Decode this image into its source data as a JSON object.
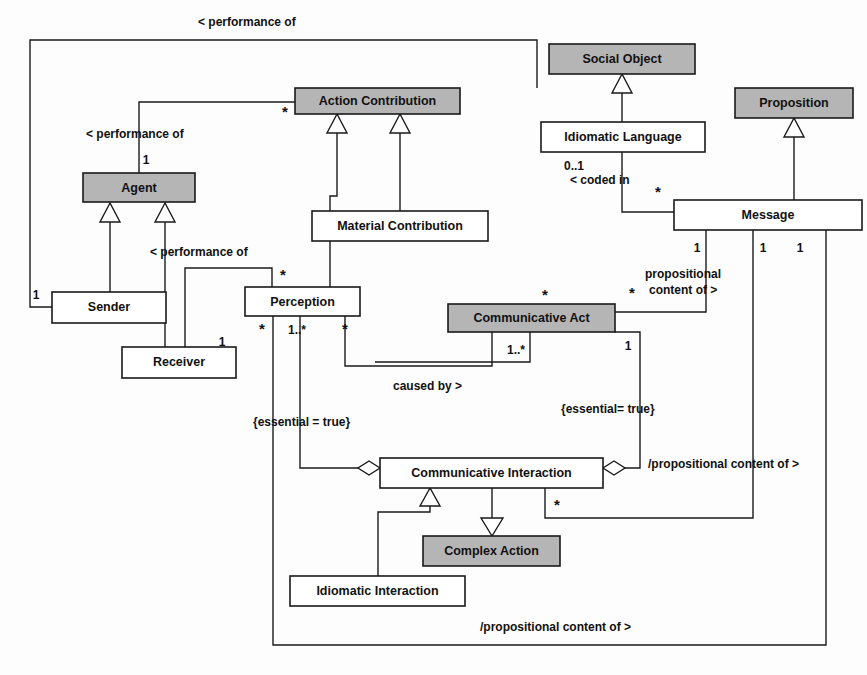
{
  "diagram": {
    "kind": "uml-class-diagram",
    "colors": {
      "shaded_fill": "#b5b5b5",
      "plain_fill": "#ffffff",
      "line": "#1a1a1a",
      "background": "#fdfdfd"
    },
    "classes": [
      {
        "id": "action-contribution",
        "label": "Action Contribution",
        "shaded": true,
        "x": 295,
        "y": 88,
        "w": 165,
        "h": 26
      },
      {
        "id": "agent",
        "label": "Agent",
        "shaded": true,
        "x": 83,
        "y": 173,
        "w": 112,
        "h": 29
      },
      {
        "id": "material-contribution",
        "label": "Material Contribution",
        "shaded": false,
        "x": 312,
        "y": 211,
        "w": 176,
        "h": 30
      },
      {
        "id": "sender",
        "label": "Sender",
        "shaded": false,
        "x": 52,
        "y": 292,
        "w": 114,
        "h": 31
      },
      {
        "id": "receiver",
        "label": "Receiver",
        "shaded": false,
        "x": 122,
        "y": 347,
        "w": 114,
        "h": 31
      },
      {
        "id": "perception",
        "label": "Perception",
        "shaded": false,
        "x": 245,
        "y": 287,
        "w": 115,
        "h": 29
      },
      {
        "id": "communicative-act",
        "label": "Communicative Act",
        "shaded": true,
        "x": 448,
        "y": 304,
        "w": 167,
        "h": 28
      },
      {
        "id": "social-object",
        "label": "Social Object",
        "shaded": true,
        "x": 549,
        "y": 44,
        "w": 146,
        "h": 30
      },
      {
        "id": "idiomatic-language",
        "label": "Idiomatic Language",
        "shaded": false,
        "x": 541,
        "y": 122,
        "w": 164,
        "h": 30
      },
      {
        "id": "proposition",
        "label": "Proposition",
        "shaded": true,
        "x": 735,
        "y": 88,
        "w": 118,
        "h": 30
      },
      {
        "id": "message",
        "label": "Message",
        "shaded": false,
        "x": 674,
        "y": 200,
        "w": 188,
        "h": 30
      },
      {
        "id": "communicative-interaction",
        "label": "Communicative Interaction",
        "shaded": false,
        "x": 380,
        "y": 458,
        "w": 223,
        "h": 30
      },
      {
        "id": "complex-action",
        "label": "Complex Action",
        "shaded": true,
        "x": 423,
        "y": 536,
        "w": 137,
        "h": 30
      },
      {
        "id": "idiomatic-interaction",
        "label": "Idiomatic Interaction",
        "shaded": false,
        "x": 290,
        "y": 576,
        "w": 175,
        "h": 30
      }
    ],
    "association_labels": [
      {
        "id": "perf-of-top",
        "text": "< performance of",
        "x": 198,
        "y": 26,
        "anchor": "start"
      },
      {
        "id": "perf-of-agent",
        "text": "< performance of",
        "x": 86,
        "y": 138,
        "anchor": "start"
      },
      {
        "id": "perf-of-receiver",
        "text": "< performance of",
        "x": 150,
        "y": 256,
        "anchor": "start"
      },
      {
        "id": "coded-in",
        "text": "< coded in",
        "x": 570,
        "y": 184,
        "anchor": "start"
      },
      {
        "id": "prop-content-1",
        "text": "propositional",
        "x": 645,
        "y": 278,
        "anchor": "start"
      },
      {
        "id": "prop-content-2",
        "text": "content of >",
        "x": 649,
        "y": 294,
        "anchor": "start"
      },
      {
        "id": "caused-by",
        "text": "caused by >",
        "x": 393,
        "y": 390,
        "anchor": "start"
      },
      {
        "id": "essential-left",
        "text": "{essential = true}",
        "x": 253,
        "y": 426,
        "anchor": "start"
      },
      {
        "id": "essential-right",
        "text": "{essential= true}",
        "x": 561,
        "y": 413,
        "anchor": "start"
      },
      {
        "id": "prop-content-mid",
        "text": "/propositional content of >",
        "x": 648,
        "y": 468,
        "anchor": "start"
      },
      {
        "id": "prop-content-bot",
        "text": "/propositional content of >",
        "x": 480,
        "y": 631,
        "anchor": "start"
      }
    ],
    "multiplicities": [
      {
        "id": "m-action-contrib-star",
        "text": "*",
        "x": 285,
        "y": 117
      },
      {
        "id": "m-agent-1",
        "text": "1",
        "x": 146,
        "y": 160
      },
      {
        "id": "m-sender-1",
        "text": "1",
        "x": 36,
        "y": 295
      },
      {
        "id": "m-receiver-1",
        "text": "1",
        "x": 222,
        "y": 342
      },
      {
        "id": "m-perception-star-in",
        "text": "*",
        "x": 283,
        "y": 275
      },
      {
        "id": "m-perception-star-a",
        "text": "*",
        "x": 262,
        "y": 330
      },
      {
        "id": "m-perception-1star",
        "text": "1..*",
        "x": 297,
        "y": 330
      },
      {
        "id": "m-perception-star-b",
        "text": "*",
        "x": 345,
        "y": 330
      },
      {
        "id": "m-commact-star-top",
        "text": "*",
        "x": 545,
        "y": 296
      },
      {
        "id": "m-commact-1star",
        "text": "1..*",
        "x": 516,
        "y": 350
      },
      {
        "id": "m-commact-star-right",
        "text": "*",
        "x": 630,
        "y": 294
      },
      {
        "id": "m-commact-1-right",
        "text": "1",
        "x": 628,
        "y": 346
      },
      {
        "id": "m-idiomlang-01",
        "text": "0..1",
        "x": 574,
        "y": 166
      },
      {
        "id": "m-message-star-left",
        "text": "*",
        "x": 656,
        "y": 193
      },
      {
        "id": "m-message-1a",
        "text": "1",
        "x": 697,
        "y": 248
      },
      {
        "id": "m-message-1b",
        "text": "1",
        "x": 763,
        "y": 248
      },
      {
        "id": "m-message-1c",
        "text": "1",
        "x": 800,
        "y": 248
      },
      {
        "id": "m-interaction-star",
        "text": "*",
        "x": 557,
        "y": 506
      }
    ],
    "relations": [
      {
        "id": "gen-action-to-material",
        "type": "generalization",
        "from": "material-contribution",
        "to": "action-contribution"
      },
      {
        "id": "gen-action-to-percept-branch",
        "type": "generalization",
        "from": "perception",
        "to": "action-contribution"
      },
      {
        "id": "gen-agent-to-sender",
        "type": "generalization",
        "from": "sender",
        "to": "agent"
      },
      {
        "id": "gen-agent-to-receiver",
        "type": "generalization",
        "from": "receiver",
        "to": "agent"
      },
      {
        "id": "gen-social-to-idiomlang",
        "type": "generalization",
        "from": "idiomatic-language",
        "to": "social-object"
      },
      {
        "id": "gen-prop-to-message",
        "type": "generalization",
        "from": "message",
        "to": "proposition"
      },
      {
        "id": "gen-ci-to-idiomatic",
        "type": "generalization",
        "from": "idiomatic-interaction",
        "to": "communicative-interaction"
      },
      {
        "id": "gen-ci-to-complex",
        "type": "generalization",
        "from": "communicative-interaction",
        "to": "complex-action"
      },
      {
        "id": "agg-ci-perception",
        "type": "aggregation",
        "from": "communicative-interaction",
        "to": "perception"
      },
      {
        "id": "agg-ci-commact",
        "type": "aggregation",
        "from": "communicative-interaction",
        "to": "communicative-act"
      },
      {
        "id": "assoc-performance-of-top",
        "type": "association",
        "from": "sender",
        "to": "action-contribution"
      },
      {
        "id": "assoc-performance-of-agent",
        "type": "association",
        "from": "agent",
        "to": "action-contribution"
      },
      {
        "id": "assoc-performance-of-recv",
        "type": "association",
        "from": "receiver",
        "to": "perception"
      },
      {
        "id": "assoc-coded-in",
        "type": "association",
        "from": "message",
        "to": "idiomatic-language"
      },
      {
        "id": "assoc-prop-content-of",
        "type": "association",
        "from": "communicative-act",
        "to": "message"
      },
      {
        "id": "assoc-caused-by",
        "type": "association",
        "from": "perception",
        "to": "communicative-act"
      },
      {
        "id": "assoc-prop-content-mid",
        "type": "association",
        "from": "communicative-interaction",
        "to": "message"
      },
      {
        "id": "assoc-prop-content-bot",
        "type": "association",
        "from": "perception",
        "to": "message"
      }
    ]
  }
}
